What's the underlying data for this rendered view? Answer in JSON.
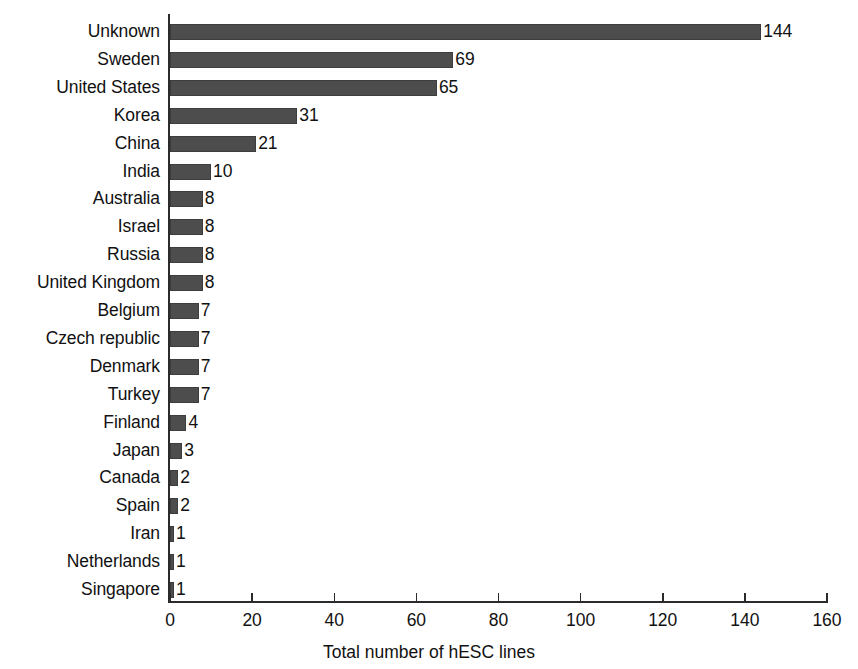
{
  "chart_data": {
    "type": "bar",
    "orientation": "horizontal",
    "title": "",
    "xlabel": "Total number of hESC lines",
    "ylabel": "",
    "xlim": [
      0,
      160
    ],
    "xticks": [
      0,
      20,
      40,
      60,
      80,
      100,
      120,
      140,
      160
    ],
    "grid": false,
    "legend": null,
    "bar_color": "#4d4d4d",
    "axis_color": "#2b2b2b",
    "categories": [
      "Unknown",
      "Sweden",
      "United States",
      "Korea",
      "China",
      "India",
      "Australia",
      "Israel",
      "Russia",
      "United Kingdom",
      "Belgium",
      "Czech republic",
      "Denmark",
      "Turkey",
      "Finland",
      "Japan",
      "Canada",
      "Spain",
      "Iran",
      "Netherlands",
      "Singapore"
    ],
    "values": [
      144,
      69,
      65,
      31,
      21,
      10,
      8,
      8,
      8,
      8,
      7,
      7,
      7,
      7,
      4,
      3,
      2,
      2,
      1,
      1,
      1
    ],
    "data_labels": [
      "144",
      "69",
      "65",
      "31",
      "21",
      "10",
      "8",
      "8",
      "8",
      "8",
      "7",
      "7",
      "7",
      "7",
      "4",
      "3",
      "2",
      "2",
      "1",
      "1",
      "1"
    ],
    "xtick_labels": [
      "0",
      "20",
      "40",
      "60",
      "80",
      "100",
      "120",
      "140",
      "160"
    ]
  }
}
